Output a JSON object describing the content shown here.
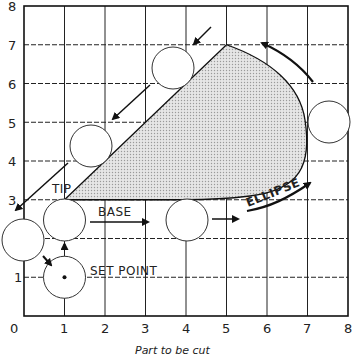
{
  "figure": {
    "caption": "Part to be cut",
    "x_ticks": [
      "0",
      "1",
      "2",
      "3",
      "4",
      "5",
      "6",
      "7",
      "8"
    ],
    "y_ticks": [
      "1",
      "2",
      "3",
      "4",
      "5",
      "6",
      "7",
      "8"
    ],
    "labels": {
      "tip": "TIP",
      "base": "BASE",
      "set_point": "SET POINT",
      "ellipse": "ELLIPSE"
    }
  },
  "geometry": {
    "x_range": [
      0,
      8
    ],
    "y_range": [
      0,
      8
    ],
    "part_vertices": {
      "tip": [
        1,
        3
      ],
      "top": [
        5,
        7
      ],
      "right_extreme": [
        7,
        5
      ],
      "base_end": [
        4,
        3
      ]
    },
    "cutter_positions": [
      {
        "name": "set-point",
        "center": [
          1,
          1
        ]
      },
      {
        "name": "left-start",
        "center": [
          -0.2,
          2
        ]
      },
      {
        "name": "at-tip",
        "center": [
          1,
          2.5
        ]
      },
      {
        "name": "base-end",
        "center": [
          4,
          2.5
        ]
      },
      {
        "name": "right",
        "center": [
          7.5,
          5
        ]
      },
      {
        "name": "top",
        "center": [
          4.25,
          6.4
        ]
      },
      {
        "name": "upper-left",
        "center": [
          1.7,
          4.4
        ]
      }
    ]
  }
}
